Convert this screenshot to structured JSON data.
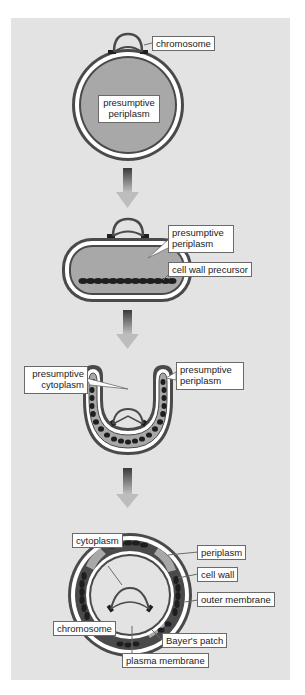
{
  "diagram": {
    "stages": [
      {
        "name": "stage-1-spherical-cell",
        "labels": {
          "chromosome": "chromosome",
          "presumptive_periplasm": [
            "presumptive",
            "periplasm"
          ]
        }
      },
      {
        "name": "stage-2-flattened-cell",
        "labels": {
          "presumptive_periplasm": [
            "presumptive",
            "periplasm"
          ],
          "cell_wall_precursor": "cell wall precursor"
        }
      },
      {
        "name": "stage-3-invaginating-cell",
        "labels": {
          "presumptive_cytoplasm": [
            "presumptive",
            "cytoplasm"
          ],
          "presumptive_periplasm": [
            "presumptive",
            "periplasm"
          ]
        }
      },
      {
        "name": "stage-4-double-membrane-cell",
        "labels": {
          "cytoplasm": "cytoplasm",
          "periplasm": "periplasm",
          "cell_wall": "cell wall",
          "outer_membrane": "outer membrane",
          "chromosome": "chromosome",
          "bayers_patch": "Bayer's patch",
          "plasma_membrane": "plasma membrane"
        }
      }
    ],
    "arrows": [
      "down-arrow",
      "down-arrow",
      "down-arrow"
    ],
    "colors": {
      "background": "#e3e3e3",
      "membrane_dark": "#4a4a4a",
      "periplasm_fill": "#a8a8a8",
      "cell_wall_beads": "#1e1e1e",
      "label_bg": "#ffffff"
    }
  }
}
